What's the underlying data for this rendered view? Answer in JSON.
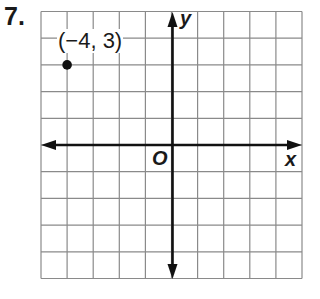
{
  "problem": {
    "number": "7."
  },
  "graph": {
    "x_axis_label": "x",
    "y_axis_label": "y",
    "origin_label": "O",
    "grid": {
      "columns": 10,
      "rows": 10,
      "x_range": [
        -5,
        5
      ],
      "y_range": [
        -5,
        5
      ]
    },
    "colors": {
      "grid": "#8a8a8a",
      "axis": "#111111",
      "point": "#111111"
    },
    "points": [
      {
        "x": -4,
        "y": 3,
        "label": "(−4, 3)"
      }
    ]
  },
  "chart_data": {
    "type": "scatter",
    "title": "",
    "xlabel": "x",
    "ylabel": "y",
    "xlim": [
      -5,
      5
    ],
    "ylim": [
      -5,
      5
    ],
    "grid": true,
    "series": [
      {
        "name": "point",
        "x": [
          -4
        ],
        "y": [
          3
        ],
        "labels": [
          "(−4, 3)"
        ]
      }
    ]
  }
}
